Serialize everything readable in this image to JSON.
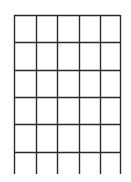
{
  "diagram": {
    "type": "grid",
    "columns": 5,
    "closed_rows": 5,
    "open_bottom_row": true,
    "line_color": "#2a2a2a",
    "background": "#ffffff",
    "vertical_lines_x": [
      14,
      36,
      57,
      79,
      100,
      120
    ],
    "horizontal_lines_y": [
      15,
      42,
      70,
      97,
      124,
      152
    ],
    "vertical_extent": [
      15,
      174
    ]
  }
}
